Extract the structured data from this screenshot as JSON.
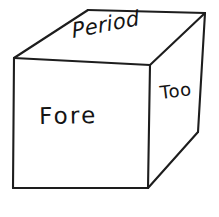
{
  "drawing": {
    "kind": "hand-drawn-cube-sketch",
    "background_color": "#ffffff",
    "line_color": "#1d1d1d",
    "text_color": "#141414",
    "faces": {
      "top": {
        "name": "top-face",
        "label": "Period",
        "rotation_deg": -11,
        "polygon": "88,10 205,13 150,65 14,58"
      },
      "front": {
        "name": "front-face",
        "label": "Fore",
        "rotation_deg": -1,
        "polygon": "14,58 150,65 148,188 13,188"
      },
      "right": {
        "name": "right-face",
        "label": "Too",
        "rotation_deg": -7,
        "polygon": "150,65 205,13 198,132 148,188"
      }
    },
    "edges": [
      {
        "name": "edge-top-back-left",
        "path": "M 14,58 L 88,10"
      },
      {
        "name": "edge-top-back",
        "path": "M 88,10 L 205,13"
      },
      {
        "name": "edge-top-right-back",
        "path": "M 205,13 L 150,65"
      },
      {
        "name": "edge-top-front",
        "path": "M 150,65 L 14,58"
      },
      {
        "name": "edge-front-left-vertical",
        "path": "M 14,58 L 13,188"
      },
      {
        "name": "edge-front-bottom",
        "path": "M 13,188 L 148,188"
      },
      {
        "name": "edge-front-right-vertical",
        "path": "M 150,65 L 148,188"
      },
      {
        "name": "edge-right-far-vertical",
        "path": "M 205,13 L 198,132"
      },
      {
        "name": "edge-right-bottom",
        "path": "M 198,132 L 148,188"
      }
    ]
  }
}
